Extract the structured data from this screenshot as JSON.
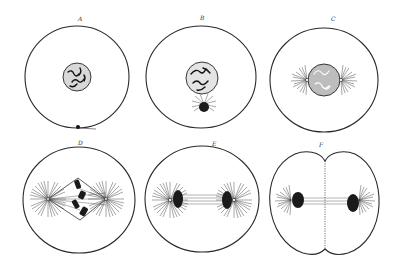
{
  "figure": {
    "background": "#ffffff",
    "line_color": "#2a2a2a"
  },
  "panels": [
    {
      "id": "A",
      "label": "A",
      "stage": "resting cell with nucleus and centrosome"
    },
    {
      "id": "B",
      "label": "B",
      "stage": "centrosome with aster beside nucleus"
    },
    {
      "id": "C",
      "label": "C",
      "stage": "prophase: asters at opposite sides of nucleus"
    },
    {
      "id": "D",
      "label": "D",
      "stage": "metaphase: spindle with chromosomes between two asters"
    },
    {
      "id": "E",
      "label": "E",
      "stage": "anaphase: chromosomes moved to poles"
    },
    {
      "id": "F",
      "label": "F",
      "stage": "telophase: cell dividing with furrow"
    }
  ]
}
